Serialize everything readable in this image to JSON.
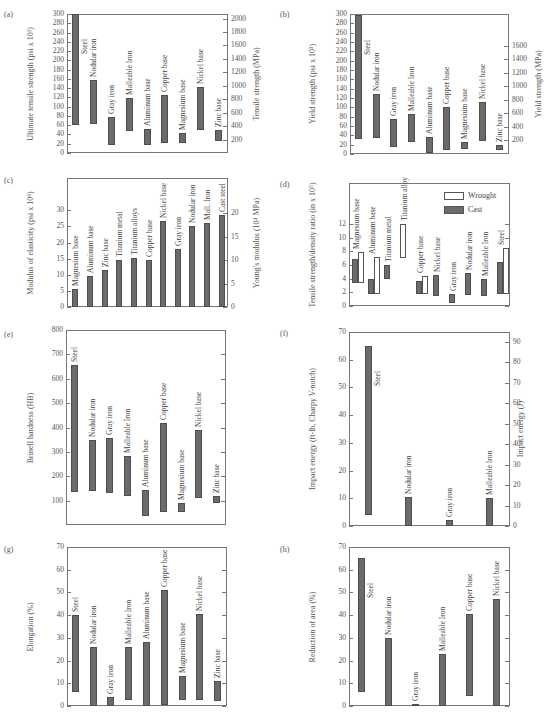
{
  "chart_data": [
    {
      "id": "a",
      "panel_label": "(a)",
      "type": "range-bar",
      "ylabel": "Ultimate tensile strength (psi x 10³)",
      "ylabel_right": "Tensile strength (MPa)",
      "ylim": [
        0,
        300
      ],
      "yticks": [
        0,
        20,
        40,
        60,
        80,
        100,
        120,
        140,
        160,
        180,
        200,
        220,
        240,
        260,
        280,
        300
      ],
      "yticks_right": [
        200,
        400,
        600,
        800,
        1000,
        1200,
        1400,
        1600,
        1800,
        2000
      ],
      "right_scale_factor": 6.895,
      "bars": [
        {
          "label": "Steel",
          "low": 60,
          "high": 300
        },
        {
          "label": "Nodular iron",
          "low": 62,
          "high": 158
        },
        {
          "label": "Gray iron",
          "low": 18,
          "high": 78
        },
        {
          "label": "Malleable Iron",
          "low": 48,
          "high": 118
        },
        {
          "label": "Aluminum base",
          "low": 18,
          "high": 52
        },
        {
          "label": "Copper base",
          "low": 22,
          "high": 125
        },
        {
          "label": "Magnesium base",
          "low": 22,
          "high": 44
        },
        {
          "label": "Nickel base",
          "low": 50,
          "high": 142
        },
        {
          "label": "Zinc base",
          "low": 25,
          "high": 50
        }
      ]
    },
    {
      "id": "b",
      "panel_label": "(b)",
      "type": "range-bar",
      "ylabel": "Yield strength (psi x 10³)",
      "ylabel_right": "Yield strength (MPa)",
      "ylim": [
        0,
        300
      ],
      "yticks": [
        0,
        20,
        40,
        60,
        80,
        100,
        120,
        140,
        160,
        180,
        200,
        220,
        240,
        260,
        280,
        300
      ],
      "yticks_right": [
        200,
        400,
        600,
        800,
        1000,
        1200,
        1400,
        1600
      ],
      "right_scale_factor": 6.895,
      "bars": [
        {
          "label": "Steel",
          "low": 32,
          "high": 298
        },
        {
          "label": "Nodular iron",
          "low": 35,
          "high": 128
        },
        {
          "label": "Gray iron",
          "low": 14,
          "high": 75
        },
        {
          "label": "Malleable Iron",
          "low": 26,
          "high": 86
        },
        {
          "label": "Aluminum base",
          "low": 3,
          "high": 36
        },
        {
          "label": "Copper base",
          "low": 8,
          "high": 101
        },
        {
          "label": "Magnesium base",
          "low": 10,
          "high": 25
        },
        {
          "label": "Nickel base",
          "low": 28,
          "high": 112
        },
        {
          "label": "Zinc base",
          "low": 8,
          "high": 20
        }
      ]
    },
    {
      "id": "c",
      "panel_label": "(c)",
      "type": "bar",
      "ylabel": "Modulus of elasticity (psi x 10⁶)",
      "ylabel_right": "Young's modulus (10⁴ MPa)",
      "ylim": [
        0,
        40
      ],
      "yticks": [
        0,
        5,
        10,
        15,
        20,
        25,
        30
      ],
      "yticks_right": [
        0,
        5,
        10,
        15,
        20
      ],
      "right_scale_factor": 0.6895,
      "bars": [
        {
          "label": "Magnesium base",
          "low": 0,
          "high": 5.7
        },
        {
          "label": "Aluminum base",
          "low": 0,
          "high": 9.7
        },
        {
          "label": "Zinc base",
          "low": 0,
          "high": 11.4
        },
        {
          "label": "Titanium metal",
          "low": 0,
          "high": 14.5
        },
        {
          "label": "Titanium alloys",
          "low": 0,
          "high": 15.3
        },
        {
          "label": "Copper base",
          "low": 0,
          "high": 14.5
        },
        {
          "label": "Nickel base",
          "low": 0,
          "high": 26.8
        },
        {
          "label": "Gray iron",
          "low": 0,
          "high": 18
        },
        {
          "label": "Nodular iron",
          "low": 0,
          "high": 25.2
        },
        {
          "label": "Mall. Iron",
          "low": 0,
          "high": 26.2
        },
        {
          "label": "Cast steel",
          "low": 0,
          "high": 28.5
        }
      ]
    },
    {
      "id": "d",
      "panel_label": "(d)",
      "type": "range-bar",
      "ylabel": "Tensile strength/density ratio (in x 10⁵)",
      "ylim": [
        0,
        18
      ],
      "yticks": [
        0,
        2,
        4,
        6,
        8,
        10,
        12
      ],
      "legend": [
        {
          "name": "Wrought",
          "style": "open"
        },
        {
          "name": "Cast",
          "style": "filled"
        }
      ],
      "groups": [
        {
          "label": "Magnesium base",
          "cast": [
            3.3,
            6.9
          ],
          "wrought": [
            3.3,
            7.9
          ]
        },
        {
          "label": "Aluminum base",
          "cast": [
            1.8,
            4.0
          ],
          "wrought": [
            1.8,
            7.1
          ]
        },
        {
          "label": "Titanium metal",
          "cast": [
            4.0,
            6.0
          ],
          "wrought": null
        },
        {
          "label": "Titanium alloy",
          "cast": null,
          "wrought": [
            7.0,
            12.0
          ]
        },
        {
          "label": "Copper base",
          "cast": [
            1.8,
            3.7
          ],
          "wrought": [
            1.8,
            4.4
          ]
        },
        {
          "label": "Nickel base",
          "cast": [
            1.5,
            4.5
          ],
          "wrought": null
        },
        {
          "label": "Gray iron",
          "cast": [
            0.5,
            1.8
          ],
          "wrought": null
        },
        {
          "label": "Nodular iron",
          "cast": [
            1.6,
            4.8
          ],
          "wrought": null
        },
        {
          "label": "Malleable Iron",
          "cast": [
            1.5,
            4.0
          ],
          "wrought": null
        },
        {
          "label": "Steel",
          "cast": [
            1.8,
            6.4
          ],
          "wrought": [
            1.8,
            8.5
          ]
        }
      ]
    },
    {
      "id": "e",
      "panel_label": "(e)",
      "type": "range-bar",
      "ylabel": "Brinell hardness (HB)",
      "ylim": [
        0,
        800
      ],
      "yticks": [
        100,
        200,
        300,
        400,
        500,
        600,
        700,
        800
      ],
      "bars": [
        {
          "label": "Steel",
          "low": 135,
          "high": 655
        },
        {
          "label": "Nodular iron",
          "low": 140,
          "high": 348
        },
        {
          "label": "Gray iron",
          "low": 130,
          "high": 358
        },
        {
          "label": "Malleable Iron",
          "low": 120,
          "high": 282
        },
        {
          "label": "Aluminum base",
          "low": 35,
          "high": 142
        },
        {
          "label": "Copper base",
          "low": 55,
          "high": 418
        },
        {
          "label": "Magnesium base",
          "low": 55,
          "high": 90
        },
        {
          "label": "Nickel base",
          "low": 110,
          "high": 390
        },
        {
          "label": "Zinc base",
          "low": 90,
          "high": 120
        }
      ]
    },
    {
      "id": "f",
      "panel_label": "(f)",
      "type": "range-bar",
      "ylabel": "Impact energy (ft-lb, Charpy V-notch)",
      "ylabel_right": "Impact energy (J)",
      "ylim": [
        0,
        70
      ],
      "yticks": [
        0,
        10,
        20,
        30,
        40,
        50,
        60,
        70
      ],
      "yticks_right": [
        0,
        10,
        20,
        30,
        40,
        50,
        60,
        70,
        80,
        90
      ],
      "right_scale_factor": 1.356,
      "bars": [
        {
          "label": "Steel",
          "low": 4,
          "high": 65
        },
        {
          "label": "Nodular iron",
          "low": 0,
          "high": 10.5
        },
        {
          "label": "Gray iron",
          "low": 0,
          "high": 2
        },
        {
          "label": "Malleable Iron",
          "low": 0,
          "high": 10
        }
      ]
    },
    {
      "id": "g",
      "panel_label": "(g)",
      "type": "range-bar",
      "ylabel": "Elongation (%)",
      "ylim": [
        0,
        70
      ],
      "yticks": [
        0,
        10,
        20,
        30,
        40,
        50,
        60,
        70
      ],
      "bars": [
        {
          "label": "Steel",
          "low": 6,
          "high": 40
        },
        {
          "label": "Nodular iron",
          "low": 0,
          "high": 26
        },
        {
          "label": "Gray iron",
          "low": 0,
          "high": 4
        },
        {
          "label": "Malleable Iron",
          "low": 2.5,
          "high": 26
        },
        {
          "label": "Aluminum base",
          "low": 0,
          "high": 28
        },
        {
          "label": "Copper base",
          "low": 0.5,
          "high": 51
        },
        {
          "label": "Magnesium base",
          "low": 2.5,
          "high": 13
        },
        {
          "label": "Nickel base",
          "low": 2.5,
          "high": 40.5
        },
        {
          "label": "Zinc base",
          "low": 2,
          "high": 11
        }
      ]
    },
    {
      "id": "h",
      "panel_label": "(h)",
      "type": "range-bar",
      "ylabel": "Reduction of area (%)",
      "ylim": [
        0,
        70
      ],
      "yticks": [
        0,
        10,
        20,
        30,
        40,
        50,
        60,
        70
      ],
      "bars": [
        {
          "label": "Steel",
          "low": 6,
          "high": 65
        },
        {
          "label": "Nodular iron",
          "low": 0,
          "high": 30
        },
        {
          "label": "Gray iron",
          "low": 0,
          "high": 1
        },
        {
          "label": "Malleable Iron",
          "low": 0,
          "high": 23
        },
        {
          "label": "Copper base",
          "low": 4.5,
          "high": 40.5
        },
        {
          "label": "Nickel base",
          "low": 0,
          "high": 47
        }
      ]
    }
  ],
  "layout": [
    {
      "id": "a",
      "frame": {
        "x": 67,
        "y": 14,
        "w": 161,
        "h": 139
      },
      "plabel": {
        "x": 4,
        "y": 10
      },
      "ylabel_x": 36,
      "ylabel_r_x": 262
    },
    {
      "id": "b",
      "frame": {
        "x": 350,
        "y": 14,
        "w": 159,
        "h": 140
      },
      "plabel": {
        "x": 280,
        "y": 10
      },
      "ylabel_x": 318,
      "ylabel_r_x": 544
    },
    {
      "id": "c",
      "frame": {
        "x": 67,
        "y": 178,
        "w": 161,
        "h": 129
      },
      "plabel": {
        "x": 4,
        "y": 176
      },
      "ylabel_x": 36,
      "ylabel_r_x": 262
    },
    {
      "id": "d",
      "frame": {
        "x": 349,
        "y": 183,
        "w": 161,
        "h": 123
      },
      "plabel": {
        "x": 280,
        "y": 180
      },
      "ylabel_x": 318,
      "ylabel_r_x": null
    },
    {
      "id": "e",
      "frame": {
        "x": 66,
        "y": 330,
        "w": 160,
        "h": 195
      },
      "plabel": {
        "x": 4,
        "y": 330
      },
      "ylabel_x": 36,
      "ylabel_r_x": null
    },
    {
      "id": "f",
      "frame": {
        "x": 349,
        "y": 332,
        "w": 161,
        "h": 194
      },
      "plabel": {
        "x": 280,
        "y": 329
      },
      "ylabel_x": 318,
      "ylabel_r_x": 526
    },
    {
      "id": "g",
      "frame": {
        "x": 67,
        "y": 547,
        "w": 160,
        "h": 159
      },
      "plabel": {
        "x": 4,
        "y": 545
      },
      "ylabel_x": 36,
      "ylabel_r_x": null
    },
    {
      "id": "h",
      "frame": {
        "x": 349,
        "y": 547,
        "w": 161,
        "h": 159
      },
      "plabel": {
        "x": 280,
        "y": 545
      },
      "ylabel_x": 318,
      "ylabel_r_x": null
    }
  ]
}
